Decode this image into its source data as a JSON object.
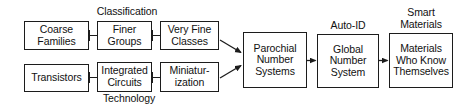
{
  "diagram": {
    "type": "flowchart",
    "title_text": "",
    "background_color": "#ffffff",
    "line_color": "#1c1c1c",
    "text_color": "#111111",
    "group_labels": [
      {
        "id": "classification",
        "text": "Classification"
      },
      {
        "id": "technology",
        "text": "Technology"
      },
      {
        "id": "auto-id",
        "text": "Auto-ID"
      },
      {
        "id": "smart-materials",
        "text": "Smart\nMaterials"
      }
    ],
    "nodes": [
      {
        "id": "coarse-families",
        "text": "Coarse\nFamilies",
        "row": "top"
      },
      {
        "id": "finer-groups",
        "text": "Finer\nGroups",
        "row": "top"
      },
      {
        "id": "very-fine-classes",
        "text": "Very Fine\nClasses",
        "row": "top"
      },
      {
        "id": "transistors",
        "text": "Transistors",
        "row": "bottom"
      },
      {
        "id": "integrated-circuits",
        "text": "Integrated\nCircuits",
        "row": "bottom"
      },
      {
        "id": "miniaturization",
        "text": "Miniatur-\nization",
        "row": "bottom"
      },
      {
        "id": "parochial-number-systems",
        "text": "Parochial\nNumber\nSystems",
        "row": "merge"
      },
      {
        "id": "global-number-system",
        "text": "Global\nNumber\nSystem",
        "row": "merge"
      },
      {
        "id": "materials-who-know-themselves",
        "text": "Materials\nWho Know\nThemselves",
        "row": "merge"
      }
    ],
    "edges": [
      {
        "from": "coarse-families",
        "to": "finer-groups",
        "style": "plain-link"
      },
      {
        "from": "finer-groups",
        "to": "very-fine-classes",
        "style": "plain-link"
      },
      {
        "from": "transistors",
        "to": "integrated-circuits",
        "style": "plain-link"
      },
      {
        "from": "integrated-circuits",
        "to": "miniaturization",
        "style": "plain-link"
      },
      {
        "from": "very-fine-classes",
        "to": "parochial-number-systems",
        "style": "arrow-diagonal-down"
      },
      {
        "from": "miniaturization",
        "to": "parochial-number-systems",
        "style": "arrow-diagonal-up"
      },
      {
        "from": "parochial-number-systems",
        "to": "global-number-system",
        "style": "arrow-horizontal"
      },
      {
        "from": "global-number-system",
        "to": "materials-who-know-themselves",
        "style": "arrow-horizontal"
      }
    ]
  }
}
